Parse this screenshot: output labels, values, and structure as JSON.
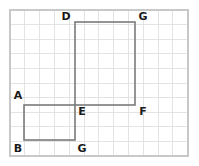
{
  "figure": {
    "background_color": "#ffffff",
    "canvas": {
      "width": 199,
      "height": 166
    },
    "grid": {
      "frame_color": "#c8c8c8",
      "line_color": "#dcdcdc",
      "major_line_color": "#cfcfcf",
      "cell_size": 14.8,
      "origin_x": 10,
      "origin_y": 10,
      "columns": 12,
      "rows": 10,
      "visible": true
    },
    "shapes": [
      {
        "name": "large-rectangle",
        "stroke_color": "#7a7a7a",
        "x": 75,
        "y": 22,
        "width": 60,
        "height": 83,
        "corner_labels": [
          "D",
          "G",
          "F",
          "E"
        ]
      },
      {
        "name": "small-rectangle",
        "stroke_color": "#7a7a7a",
        "x": 24,
        "y": 105,
        "width": 51,
        "height": 35,
        "corner_labels": [
          "A",
          "E",
          "G",
          "B"
        ]
      }
    ],
    "labels": [
      {
        "id": "label-d",
        "text": "D",
        "x": 66,
        "y": 16
      },
      {
        "id": "label-g-top",
        "text": "G",
        "x": 143,
        "y": 16
      },
      {
        "id": "label-a",
        "text": "A",
        "x": 18,
        "y": 96
      },
      {
        "id": "label-e",
        "text": "E",
        "x": 82,
        "y": 111
      },
      {
        "id": "label-f",
        "text": "F",
        "x": 143,
        "y": 111
      },
      {
        "id": "label-b",
        "text": "B",
        "x": 18,
        "y": 148
      },
      {
        "id": "label-g-bottom",
        "text": "G",
        "x": 82,
        "y": 148
      }
    ]
  }
}
